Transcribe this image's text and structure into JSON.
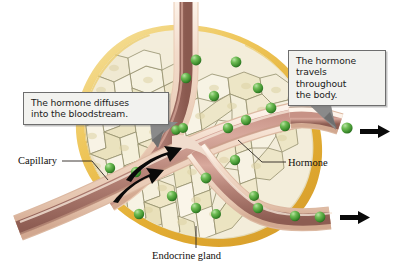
{
  "figure": {
    "width": 398,
    "height": 274,
    "background": "#ffffff"
  },
  "callouts": [
    {
      "id": "callout-diffuses",
      "name": "callout-hormone-diffuses",
      "line1": "The hormone diffuses",
      "line2": "into the bloodstream.",
      "text": "The hormone diffuses into the bloodstream.",
      "box_fill": "#f2f2ef",
      "box_border": "#6e6e6e",
      "pointer_color": "#787878",
      "pointer_target": "capillary-wall"
    },
    {
      "id": "callout-travels",
      "name": "callout-hormone-travels",
      "line1": "The hormone",
      "line2": "travels",
      "line3": "throughout",
      "line4": "the body.",
      "text": "The hormone travels throughout the body.",
      "box_fill": "#f2f2ef",
      "box_border": "#6e6e6e",
      "pointer_color": "#787878",
      "pointer_target": "exiting-hormone"
    }
  ],
  "labels": [
    {
      "id": "label-capillary",
      "name": "label-capillary",
      "text": "Capillary",
      "leader": "horizontal-then-diagonal",
      "color": "#100d0a"
    },
    {
      "id": "label-hormone",
      "name": "label-hormone",
      "text": "Hormone",
      "leader": "horizontal",
      "color": "#100d0a"
    },
    {
      "id": "label-gland",
      "name": "label-endocrine-gland",
      "text": "Endocrine gland",
      "leader": "vertical",
      "color": "#100d0a"
    }
  ],
  "colors": {
    "gland_capsule_outer": "#e8b63f",
    "gland_capsule_mid": "#f0cf72",
    "gland_capsule_light": "#f7e6ac",
    "cell_fill": "#f4efdd",
    "cell_fill_alt": "#ece4c2",
    "cell_outline": "#8f8b6a",
    "cell_shade": "#d9cf9c",
    "hormone_green": "#4aa03c",
    "hormone_green_light": "#8fd07a",
    "hormone_green_dark": "#2f7328",
    "vessel_wall": "#efd9c8",
    "vessel_wall_edge": "#c9a48c",
    "vessel_lumen": "#b07f72",
    "vessel_lumen_dark": "#8e5f55",
    "vessel_lumen_light": "#cfa093",
    "arrow_black": "#0a0a0a",
    "callout_fill": "#f2f2ef",
    "callout_border": "#6e6e6e",
    "text_black": "#100d0a"
  },
  "elements": {
    "gland": {
      "name": "endocrine-gland-tissue",
      "description": "Rounded triangular mass of pale polygonal secretory cells enclosed by a golden capsule"
    },
    "capillaries": {
      "name": "capillary-network",
      "count": 4,
      "description": "Branching blood vessels with pale walls and rosy lumen crossing the gland"
    },
    "hormones": {
      "name": "hormone-molecules",
      "color": "#4aa03c",
      "description": "Green spheres within gland tissue and inside the capillary lumen"
    },
    "diffusion_arrows": {
      "name": "diffusion-arrows",
      "count": 2,
      "color": "#0a0a0a",
      "direction": "up-right into capillary"
    },
    "flow_arrows": {
      "name": "bloodflow-exit-arrows",
      "count": 2,
      "color": "#0a0a0a",
      "direction": "right"
    }
  }
}
